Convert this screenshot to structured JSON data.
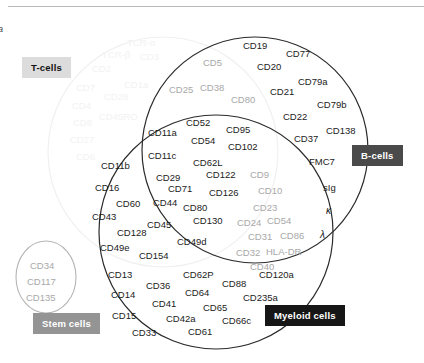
{
  "figure": {
    "letter": "a",
    "caption": ""
  },
  "groups": {
    "tcells": {
      "label": "T-cells",
      "style": "light",
      "color": "#dcdcdc"
    },
    "bcells": {
      "label": "B-cells",
      "style": "mid",
      "color": "#4a4a4a"
    },
    "stem": {
      "label": "Stem cells",
      "style": "grey",
      "color": "#949494"
    },
    "myeloid": {
      "label": "Myeloid cells",
      "style": "dark",
      "color": "#161616"
    }
  },
  "chart_data": {
    "type": "diagram",
    "subtype": "venn",
    "sets": [
      "T-cells",
      "B-cells",
      "Stem cells",
      "Myeloid cells"
    ],
    "legend_position": "inline-chips",
    "regions": [
      {
        "name": "T-cells only",
        "set": [
          "T-cells"
        ],
        "rendering": "faint",
        "markers": [
          "TCR-a",
          "TCR-b",
          "CD3",
          "CD2",
          "CD4",
          "CD7",
          "CD1a",
          "CD5",
          "CD8",
          "CD28",
          "CD27",
          "CD45RO",
          "CD6"
        ]
      },
      {
        "name": "T-cells and B-cells",
        "set": [
          "T-cells",
          "B-cells"
        ],
        "rendering": "grey",
        "markers": [
          "CD5",
          "CD38",
          "CD25",
          "CD80"
        ]
      },
      {
        "name": "B-cells only",
        "set": [
          "B-cells"
        ],
        "rendering": "solid",
        "markers": [
          "CD19",
          "CD77",
          "CD20",
          "CD79a",
          "CD21",
          "CD79b",
          "CD22",
          "CD37",
          "CD138",
          "FMC7",
          "sIg",
          "kappa",
          "lambda"
        ]
      },
      {
        "name": "T-cells, B-cells and Myeloid cells (central)",
        "set": [
          "T-cells",
          "B-cells",
          "Myeloid cells"
        ],
        "rendering": "solid",
        "markers": [
          "CD52",
          "CD11a",
          "CD95",
          "CD54",
          "CD102",
          "CD11c",
          "CD62L",
          "CD29",
          "CD122",
          "CD71",
          "CD126",
          "CD44",
          "CD80",
          "CD45",
          "CD130",
          "CD49d"
        ]
      },
      {
        "name": "B-cells and Myeloid cells",
        "set": [
          "B-cells",
          "Myeloid cells"
        ],
        "rendering": "grey",
        "markers": [
          "CD9",
          "CD10",
          "CD23",
          "CD24",
          "CD54",
          "CD31",
          "CD86",
          "CD32",
          "HLA-DR",
          "CD40"
        ]
      },
      {
        "name": "T-cells and Myeloid cells",
        "set": [
          "T-cells",
          "Myeloid cells"
        ],
        "rendering": "solid",
        "markers": [
          "CD11b",
          "CD16",
          "CD60",
          "CD43",
          "CD128",
          "CD49e",
          "CD154"
        ]
      },
      {
        "name": "Myeloid cells only",
        "set": [
          "Myeloid cells"
        ],
        "rendering": "solid",
        "markers": [
          "CD13",
          "CD36",
          "CD14",
          "CD41",
          "CD15",
          "CD42a",
          "CD33",
          "CD62P",
          "CD64",
          "CD65",
          "CD61",
          "CD88",
          "CD66c",
          "CD120a",
          "CD235a"
        ]
      },
      {
        "name": "Stem cells",
        "set": [
          "Stem cells"
        ],
        "rendering": "grey",
        "markers": [
          "CD34",
          "CD117",
          "CD135"
        ]
      }
    ]
  },
  "markers": {
    "tcell_faint": [
      {
        "t": "TCR-α",
        "x": 127,
        "y": 38
      },
      {
        "t": "TCR-β",
        "x": 102,
        "y": 50
      },
      {
        "t": "CD3",
        "x": 140,
        "y": 52
      },
      {
        "t": "CD2",
        "x": 92,
        "y": 64
      },
      {
        "t": "CD7",
        "x": 76,
        "y": 83
      },
      {
        "t": "CD1a",
        "x": 124,
        "y": 80
      },
      {
        "t": "CD4",
        "x": 72,
        "y": 101
      },
      {
        "t": "CD28",
        "x": 104,
        "y": 92
      },
      {
        "t": "CD8",
        "x": 73,
        "y": 118
      },
      {
        "t": "CD45RO",
        "x": 99,
        "y": 112
      },
      {
        "t": "CD27",
        "x": 70,
        "y": 135
      },
      {
        "t": "CD6",
        "x": 76,
        "y": 152
      }
    ],
    "tb_grey": [
      {
        "t": "CD5",
        "x": 203,
        "y": 58
      },
      {
        "t": "CD38",
        "x": 200,
        "y": 83
      },
      {
        "t": "CD25",
        "x": 169,
        "y": 85
      },
      {
        "t": "CD80",
        "x": 231,
        "y": 95
      }
    ],
    "bcell": [
      {
        "t": "CD19",
        "x": 243,
        "y": 41
      },
      {
        "t": "CD77",
        "x": 286,
        "y": 49
      },
      {
        "t": "CD20",
        "x": 257,
        "y": 62
      },
      {
        "t": "CD79a",
        "x": 298,
        "y": 77
      },
      {
        "t": "CD21",
        "x": 270,
        "y": 87
      },
      {
        "t": "CD79b",
        "x": 317,
        "y": 100
      },
      {
        "t": "CD22",
        "x": 283,
        "y": 112
      },
      {
        "t": "CD37",
        "x": 294,
        "y": 134
      },
      {
        "t": "CD138",
        "x": 326,
        "y": 126
      },
      {
        "t": "FMC7",
        "x": 309,
        "y": 157
      },
      {
        "t": "sIg",
        "x": 323,
        "y": 183
      },
      {
        "t": "κ",
        "x": 326,
        "y": 206,
        "ital": true
      },
      {
        "t": "λ",
        "x": 320,
        "y": 230,
        "ital": true
      }
    ],
    "center": [
      {
        "t": "CD52",
        "x": 186,
        "y": 118
      },
      {
        "t": "CD11a",
        "x": 148,
        "y": 128
      },
      {
        "t": "CD95",
        "x": 226,
        "y": 125
      },
      {
        "t": "CD54",
        "x": 191,
        "y": 136
      },
      {
        "t": "CD102",
        "x": 228,
        "y": 142
      },
      {
        "t": "CD11c",
        "x": 148,
        "y": 151
      },
      {
        "t": "CD62L",
        "x": 193,
        "y": 158
      },
      {
        "t": "CD11b",
        "x": 101,
        "y": 161
      },
      {
        "t": "CD29",
        "x": 156,
        "y": 173
      },
      {
        "t": "CD122",
        "x": 206,
        "y": 170
      },
      {
        "t": "CD16",
        "x": 95,
        "y": 183
      },
      {
        "t": "CD71",
        "x": 168,
        "y": 184
      },
      {
        "t": "CD126",
        "x": 209,
        "y": 188
      },
      {
        "t": "CD60",
        "x": 116,
        "y": 199
      },
      {
        "t": "CD44",
        "x": 153,
        "y": 198
      },
      {
        "t": "CD43",
        "x": 92,
        "y": 212
      },
      {
        "t": "CD80",
        "x": 183,
        "y": 203
      },
      {
        "t": "CD45",
        "x": 147,
        "y": 220
      },
      {
        "t": "CD130",
        "x": 193,
        "y": 216
      },
      {
        "t": "CD128",
        "x": 117,
        "y": 228
      },
      {
        "t": "CD49d",
        "x": 177,
        "y": 237
      },
      {
        "t": "CD49e",
        "x": 100,
        "y": 243
      },
      {
        "t": "CD154",
        "x": 139,
        "y": 251
      }
    ],
    "bm_grey": [
      {
        "t": "CD9",
        "x": 250,
        "y": 170
      },
      {
        "t": "CD10",
        "x": 258,
        "y": 186
      },
      {
        "t": "CD23",
        "x": 253,
        "y": 203
      },
      {
        "t": "CD24",
        "x": 237,
        "y": 218
      },
      {
        "t": "CD54",
        "x": 267,
        "y": 216
      },
      {
        "t": "CD31",
        "x": 248,
        "y": 232
      },
      {
        "t": "CD86",
        "x": 280,
        "y": 231
      },
      {
        "t": "CD32",
        "x": 236,
        "y": 248
      },
      {
        "t": "HLA-DR",
        "x": 266,
        "y": 247
      },
      {
        "t": "CD40",
        "x": 250,
        "y": 262
      }
    ],
    "myeloid": [
      {
        "t": "CD62P",
        "x": 183,
        "y": 270
      },
      {
        "t": "CD13",
        "x": 108,
        "y": 270
      },
      {
        "t": "CD88",
        "x": 222,
        "y": 279
      },
      {
        "t": "CD120a",
        "x": 259,
        "y": 270
      },
      {
        "t": "CD36",
        "x": 146,
        "y": 281
      },
      {
        "t": "CD14",
        "x": 111,
        "y": 290
      },
      {
        "t": "CD64",
        "x": 185,
        "y": 288
      },
      {
        "t": "CD235a",
        "x": 243,
        "y": 293
      },
      {
        "t": "CD41",
        "x": 152,
        "y": 299
      },
      {
        "t": "CD65",
        "x": 203,
        "y": 303
      },
      {
        "t": "CD15",
        "x": 112,
        "y": 311
      },
      {
        "t": "CD42a",
        "x": 166,
        "y": 314
      },
      {
        "t": "CD66c",
        "x": 222,
        "y": 316
      },
      {
        "t": "CD33",
        "x": 132,
        "y": 328
      },
      {
        "t": "CD61",
        "x": 188,
        "y": 327
      }
    ],
    "stem": [
      {
        "t": "CD34",
        "x": 30,
        "y": 261
      },
      {
        "t": "CD117",
        "x": 27,
        "y": 277
      },
      {
        "t": "CD135",
        "x": 26,
        "y": 293
      }
    ]
  },
  "chips": {
    "tcells": {
      "x": 22,
      "y": 57,
      "label": "T-cells"
    },
    "bcells": {
      "x": 352,
      "y": 145,
      "label": "B-cells"
    },
    "stem": {
      "x": 33,
      "y": 313,
      "label": "Stem cells"
    },
    "myeloid": {
      "x": 265,
      "y": 305,
      "label": "Myeloid cells"
    }
  }
}
